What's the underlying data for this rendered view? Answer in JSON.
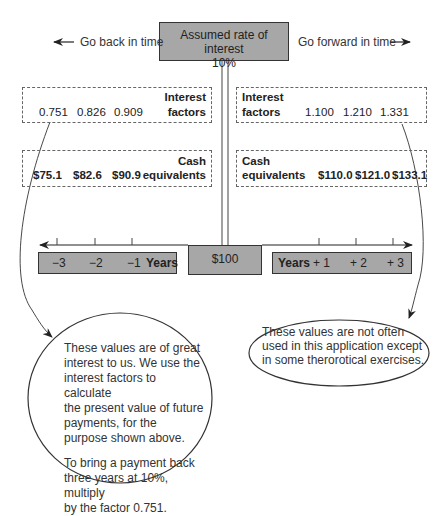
{
  "rate": {
    "line1": "Assumed rate of interest",
    "line2": "10%"
  },
  "directions": {
    "back": {
      "label": "Go back in time",
      "arrow": "left-arrow"
    },
    "forward": {
      "label": "Go forward in time",
      "arrow": "right-arrow"
    }
  },
  "past": {
    "interest_factors": {
      "label_line1": "Interest",
      "label_line2": "factors",
      "values": [
        "0.751",
        "0.826",
        "0.909"
      ]
    },
    "cash_equivalents": {
      "label_line1": "Cash",
      "label_line2": "equivalents",
      "values": [
        "$75.1",
        "$82.6",
        "$90.9"
      ]
    },
    "years": {
      "ticks": [
        "−3",
        "−2",
        "−1"
      ],
      "label": "Years"
    }
  },
  "future": {
    "interest_factors": {
      "label_line1": "Interest",
      "label_line2": "factors",
      "values": [
        "1.100",
        "1.210",
        "1.331"
      ]
    },
    "cash_equivalents": {
      "label_line1": "Cash",
      "label_line2": "equivalents",
      "values": [
        "$110.0",
        "$121.0",
        "$133.1"
      ]
    },
    "years": {
      "label": "Years",
      "ticks": [
        "+ 1",
        "+ 2",
        "+ 3"
      ]
    }
  },
  "present": {
    "value": "$100"
  },
  "notes": {
    "past": {
      "para1": [
        "These values are of great",
        "interest to us. We use the",
        "interest factors to calculate",
        "the present value of future",
        "payments, for the",
        "purpose shown above."
      ],
      "para2": [
        "To bring a payment back",
        "three years at 10%, multiply",
        "by the factor 0.751."
      ]
    },
    "future": {
      "lines": [
        "These values are not often",
        "used in this application except",
        "in some therorotical exercises."
      ]
    }
  },
  "colors": {
    "box_fill": "#a7a7a7",
    "stroke": "#333333",
    "dash": "#666666"
  }
}
